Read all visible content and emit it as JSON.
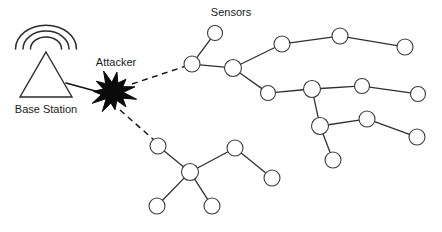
{
  "canvas": {
    "width": 442,
    "height": 232,
    "background": "#ffffff"
  },
  "labels": {
    "base_station": "Base Station",
    "attacker": "Attacker",
    "sensors": "Sensors"
  },
  "colors": {
    "background": "#ffffff",
    "node_fill": "#ffffff",
    "node_stroke": "#3a3a42",
    "edge": "#2f2f35",
    "attack_edge": "#111111",
    "attacker_fill": "#0a0a0a",
    "tower_stroke": "#2b2b2b",
    "text": "#1b1b1b"
  },
  "diagram": {
    "type": "wireless-sensor-network-attack",
    "base_station": {
      "name": "base-station",
      "apex_x": 46,
      "apex_y": 52,
      "base_left_x": 20,
      "base_right_x": 72,
      "base_y": 97,
      "label_x": 46,
      "label_y": 110,
      "waves": 3
    },
    "attacker": {
      "name": "attacker-node",
      "cx": 113,
      "cy": 92,
      "outer_radius": 22,
      "inner_radius": 11,
      "points": 11,
      "label_x": 116,
      "label_y": 63
    },
    "sensors_label": {
      "x": 231,
      "y": 13
    },
    "nodes": [
      {
        "id": "n1",
        "cx": 215,
        "cy": 33,
        "r": 7.5
      },
      {
        "id": "n2",
        "cx": 192,
        "cy": 64,
        "r": 8.0
      },
      {
        "id": "n3",
        "cx": 233,
        "cy": 68,
        "r": 8.5
      },
      {
        "id": "n4",
        "cx": 282,
        "cy": 44,
        "r": 8.0
      },
      {
        "id": "n5",
        "cx": 340,
        "cy": 36,
        "r": 8.0
      },
      {
        "id": "n6",
        "cx": 405,
        "cy": 47,
        "r": 8.0
      },
      {
        "id": "n7",
        "cx": 268,
        "cy": 93,
        "r": 7.5
      },
      {
        "id": "n8",
        "cx": 312,
        "cy": 89,
        "r": 8.5
      },
      {
        "id": "n9",
        "cx": 362,
        "cy": 86,
        "r": 7.5
      },
      {
        "id": "n10",
        "cx": 418,
        "cy": 94,
        "r": 7.5
      },
      {
        "id": "n11",
        "cx": 320,
        "cy": 126,
        "r": 8.5
      },
      {
        "id": "n12",
        "cx": 367,
        "cy": 119,
        "r": 8.0
      },
      {
        "id": "n13",
        "cx": 417,
        "cy": 137,
        "r": 8.0
      },
      {
        "id": "n14",
        "cx": 333,
        "cy": 160,
        "r": 8.0
      },
      {
        "id": "n15",
        "cx": 158,
        "cy": 146,
        "r": 8.0
      },
      {
        "id": "n16",
        "cx": 190,
        "cy": 172,
        "r": 8.5
      },
      {
        "id": "n17",
        "cx": 235,
        "cy": 148,
        "r": 8.0
      },
      {
        "id": "n18",
        "cx": 272,
        "cy": 178,
        "r": 8.0
      },
      {
        "id": "n19",
        "cx": 157,
        "cy": 206,
        "r": 8.0
      },
      {
        "id": "n20",
        "cx": 212,
        "cy": 206,
        "r": 8.0
      }
    ],
    "edges": [
      {
        "from": "n1",
        "to": "n2"
      },
      {
        "from": "n2",
        "to": "n3"
      },
      {
        "from": "n3",
        "to": "n4"
      },
      {
        "from": "n4",
        "to": "n5"
      },
      {
        "from": "n5",
        "to": "n6"
      },
      {
        "from": "n3",
        "to": "n7"
      },
      {
        "from": "n7",
        "to": "n8"
      },
      {
        "from": "n8",
        "to": "n9"
      },
      {
        "from": "n9",
        "to": "n10"
      },
      {
        "from": "n8",
        "to": "n11"
      },
      {
        "from": "n11",
        "to": "n12"
      },
      {
        "from": "n12",
        "to": "n13"
      },
      {
        "from": "n11",
        "to": "n14"
      },
      {
        "from": "n15",
        "to": "n16"
      },
      {
        "from": "n16",
        "to": "n17"
      },
      {
        "from": "n17",
        "to": "n18"
      },
      {
        "from": "n16",
        "to": "n19"
      },
      {
        "from": "n16",
        "to": "n20"
      }
    ],
    "base_station_link": {
      "from_x": 66,
      "from_y": 83,
      "to_x": 110,
      "to_y": 95
    },
    "attack_edges": [
      {
        "from_x": 132,
        "from_y": 84,
        "to_x": 186,
        "to_y": 66
      },
      {
        "from_x": 120,
        "from_y": 110,
        "to_x": 154,
        "to_y": 140
      }
    ]
  }
}
